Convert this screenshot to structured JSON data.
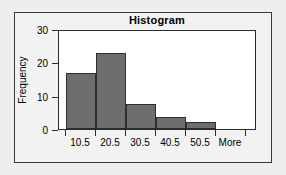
{
  "figure": {
    "title": "Histogram",
    "background_color": "#eeeeee",
    "frame_color": "#3a3a3a",
    "plot_background": "#ffffff"
  },
  "chart_data": {
    "type": "bar",
    "title": "Histogram",
    "xlabel": "",
    "ylabel": "Frequency",
    "categories": [
      "10.5",
      "20.5",
      "30.5",
      "40.5",
      "50.5",
      "More"
    ],
    "values": [
      19,
      25.5,
      8.5,
      4,
      2.5,
      0
    ],
    "ylim": [
      0,
      33
    ],
    "yticks": [
      0,
      10,
      20,
      30
    ],
    "ytick_labels": [
      "0",
      "10",
      "20",
      "30"
    ],
    "grid": false,
    "legend": false,
    "bar_color": "#6e6e6e",
    "bar_edge_color": "#2f2f2f"
  },
  "axes": {
    "y_title": "Frequency",
    "y_ticks": [
      {
        "label": "30",
        "value": 30
      },
      {
        "label": "20",
        "value": 20
      },
      {
        "label": "10",
        "value": 10
      },
      {
        "label": "0",
        "value": 0
      }
    ],
    "x_ticks": [
      {
        "label": "10.5"
      },
      {
        "label": "20.5"
      },
      {
        "label": "30.5"
      },
      {
        "label": "40.5"
      },
      {
        "label": "50.5"
      },
      {
        "label": "More"
      }
    ]
  }
}
